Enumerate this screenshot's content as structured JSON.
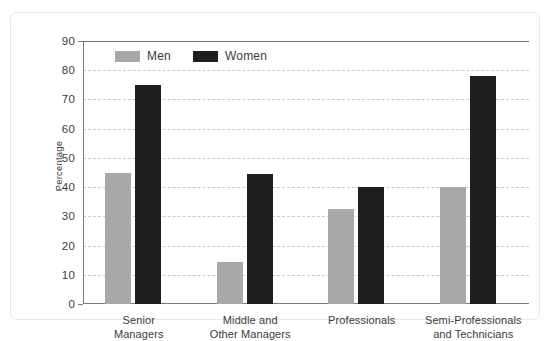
{
  "chart_data": {
    "type": "bar",
    "title": "",
    "subtitle": "",
    "xlabel": "",
    "ylabel": "Percentage",
    "ylim": [
      0,
      90
    ],
    "ytick_step": 10,
    "yticks": [
      90,
      80,
      70,
      60,
      50,
      40,
      30,
      20,
      10,
      0
    ],
    "ytick_labels": [
      "90",
      "80",
      "70",
      "60",
      "50",
      "40",
      "30",
      "20",
      "10",
      "0"
    ],
    "grid": "horizontal-dashed",
    "legend_position": "top-left-inside",
    "categories": [
      "Senior Managers",
      "Middle and Other Managers",
      "Professionals",
      "Semi-Professionals and Technicians"
    ],
    "category_lines": [
      [
        "Senior",
        "Managers"
      ],
      [
        "Middle and",
        "Other Managers"
      ],
      [
        "Professionals",
        ""
      ],
      [
        "Semi-Professionals",
        "and Technicians"
      ]
    ],
    "series": [
      {
        "name": "Men",
        "color": "#a8a8a8",
        "values": [
          45,
          14.5,
          32.5,
          40
        ]
      },
      {
        "name": "Women",
        "color": "#1f1f1f",
        "values": [
          75,
          44.5,
          40,
          78
        ]
      }
    ]
  },
  "legend": {
    "items": [
      {
        "label": "Men",
        "swatch": "men"
      },
      {
        "label": "Women",
        "swatch": "women"
      }
    ]
  }
}
